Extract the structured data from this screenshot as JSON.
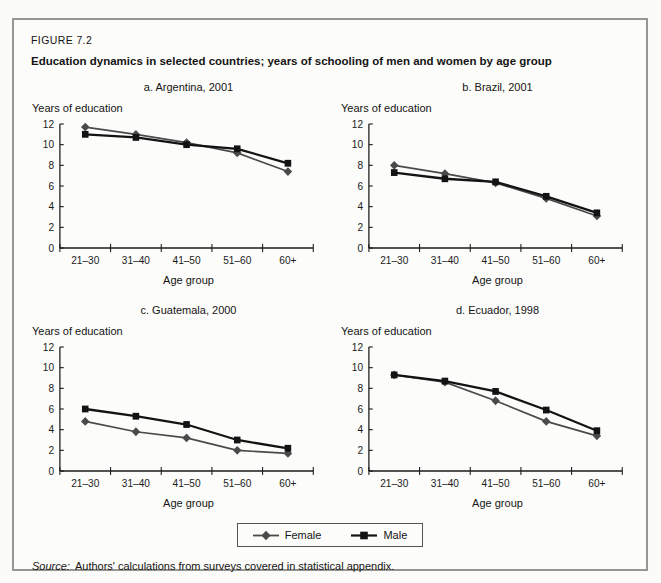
{
  "figure": {
    "label": "FIGURE 7.2",
    "title": "Education dynamics in selected countries; years of schooling of men and women by age group"
  },
  "chart_data": [
    {
      "type": "line",
      "title": "a. Argentina, 2001",
      "ylabel": "Years of education",
      "xlabel": "Age group",
      "categories": [
        "21–30",
        "31–40",
        "41–50",
        "51–60",
        "60+"
      ],
      "ylim": [
        0,
        12
      ],
      "ytick_step": 2,
      "series": [
        {
          "name": "Female",
          "marker": "diamond",
          "values": [
            11.7,
            11.0,
            10.2,
            9.2,
            7.4
          ]
        },
        {
          "name": "Male",
          "marker": "square",
          "values": [
            11.0,
            10.7,
            10.0,
            9.6,
            8.2
          ]
        }
      ]
    },
    {
      "type": "line",
      "title": "b. Brazil, 2001",
      "ylabel": "Years of education",
      "xlabel": "Age group",
      "categories": [
        "21–30",
        "31–40",
        "41–50",
        "51–60",
        "60+"
      ],
      "ylim": [
        0,
        12
      ],
      "ytick_step": 2,
      "series": [
        {
          "name": "Female",
          "marker": "diamond",
          "values": [
            8.0,
            7.2,
            6.3,
            4.8,
            3.1
          ]
        },
        {
          "name": "Male",
          "marker": "square",
          "values": [
            7.3,
            6.7,
            6.4,
            5.0,
            3.4
          ]
        }
      ]
    },
    {
      "type": "line",
      "title": "c. Guatemala, 2000",
      "ylabel": "Years of education",
      "xlabel": "Age group",
      "categories": [
        "21–30",
        "31–40",
        "41–50",
        "51–60",
        "60+"
      ],
      "ylim": [
        0,
        12
      ],
      "ytick_step": 2,
      "series": [
        {
          "name": "Female",
          "marker": "diamond",
          "values": [
            4.8,
            3.8,
            3.2,
            2.0,
            1.7
          ]
        },
        {
          "name": "Male",
          "marker": "square",
          "values": [
            6.0,
            5.3,
            4.5,
            3.0,
            2.2
          ]
        }
      ]
    },
    {
      "type": "line",
      "title": "d. Ecuador, 1998",
      "ylabel": "Years of education",
      "xlabel": "Age group",
      "categories": [
        "21–30",
        "31–40",
        "41–50",
        "51–60",
        "60+"
      ],
      "ylim": [
        0,
        12
      ],
      "ytick_step": 2,
      "series": [
        {
          "name": "Female",
          "marker": "diamond",
          "values": [
            9.3,
            8.6,
            6.8,
            4.8,
            3.4
          ]
        },
        {
          "name": "Male",
          "marker": "square",
          "values": [
            9.3,
            8.7,
            7.7,
            5.9,
            3.9
          ]
        }
      ]
    }
  ],
  "legend": {
    "items": [
      {
        "label": "Female",
        "marker": "diamond"
      },
      {
        "label": "Male",
        "marker": "square"
      }
    ]
  },
  "source": {
    "label": "Source:",
    "text": "Authors' calculations from surveys covered in statistical appendix."
  },
  "colors": {
    "female": "#4a4a4a",
    "male": "#131313",
    "axis": "#1a1a1a",
    "box_border": "#979792"
  }
}
